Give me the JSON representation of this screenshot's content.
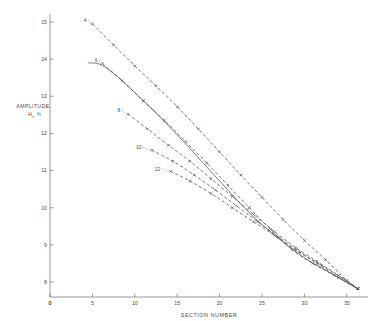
{
  "chart_data": {
    "type": "line",
    "title": "",
    "xlabel": "SECTION   NUMBER",
    "ylabel_main": "AMPLITUDE",
    "ylabel_sub_symbol": "H",
    "ylabel_sub_index": "s",
    "ylabel_units": "ft",
    "xlim": [
      0,
      37.5
    ],
    "ylim": [
      7.4,
      15.4
    ],
    "xticks": [
      0,
      5,
      10,
      15,
      20,
      25,
      30,
      35
    ],
    "xtick_labels": [
      "0",
      "5",
      "10",
      "15",
      "20",
      "25",
      "30",
      "35"
    ],
    "yticks": [
      8,
      9,
      10,
      11,
      12,
      13,
      14,
      15
    ],
    "ytick_labels": [
      "8",
      "9",
      "10",
      "11",
      "12",
      "13",
      "14",
      "15"
    ],
    "y_origin_label": "0",
    "grid": false,
    "legend_position": "inline-curve-labels",
    "axis_color": "#6e6e6e",
    "line_color": "#4f4f4f",
    "background": "#ffffff",
    "series": [
      {
        "name": "4",
        "label": "4",
        "style": "dashed",
        "marker": "x",
        "label_x": 4.3,
        "label_y": 15.05,
        "x": [
          5,
          7.5,
          10,
          12.5,
          15,
          17.5,
          20,
          22.5,
          25,
          27.5,
          30,
          32.5,
          35,
          36.3
        ],
        "y": [
          14.95,
          14.38,
          13.82,
          13.28,
          12.72,
          12.12,
          11.5,
          10.88,
          10.28,
          9.68,
          9.12,
          8.6,
          8.05,
          7.82
        ]
      },
      {
        "name": "6",
        "label": "6",
        "style": "dashed",
        "marker": "x",
        "label_x": 5.6,
        "label_y": 13.98,
        "x": [
          6.2,
          8.5,
          11,
          13.5,
          16,
          18.5,
          21,
          23.5,
          26,
          28.5,
          31,
          33.5,
          36.3
        ],
        "y": [
          13.88,
          13.42,
          12.88,
          12.35,
          11.78,
          11.2,
          10.6,
          10.0,
          9.42,
          8.88,
          8.5,
          8.18,
          7.82
        ]
      },
      {
        "name": "theoretical",
        "label": "",
        "style": "solid",
        "marker": "none",
        "label_x": null,
        "label_y": null,
        "x": [
          4.5,
          6,
          8,
          10,
          12,
          14,
          16,
          18,
          20,
          22,
          24,
          26,
          28,
          30,
          32,
          34,
          36.3
        ],
        "y": [
          13.9,
          13.85,
          13.52,
          13.1,
          12.66,
          12.2,
          11.72,
          11.22,
          10.72,
          10.22,
          9.75,
          9.35,
          8.98,
          8.65,
          8.38,
          8.12,
          7.82
        ]
      },
      {
        "name": "8",
        "label": "8",
        "style": "dashed",
        "marker": "x",
        "label_x": 8.3,
        "label_y": 12.62,
        "x": [
          9.2,
          11.5,
          14,
          16.5,
          19,
          21.5,
          24,
          26.5,
          29,
          31.5,
          34,
          36.3
        ],
        "y": [
          12.52,
          12.12,
          11.68,
          11.25,
          10.78,
          10.3,
          9.82,
          9.35,
          8.92,
          8.55,
          8.18,
          7.82
        ]
      },
      {
        "name": "10",
        "label": "10",
        "style": "dashed",
        "marker": "x",
        "label_x": 10.8,
        "label_y": 11.62,
        "x": [
          12,
          14.5,
          17,
          19.5,
          22,
          24.5,
          27,
          29.5,
          32,
          34.5,
          36.3
        ],
        "y": [
          11.55,
          11.25,
          10.88,
          10.48,
          10.05,
          9.62,
          9.2,
          8.8,
          8.45,
          8.1,
          7.82
        ]
      },
      {
        "name": "12",
        "label": "12",
        "style": "dashed",
        "marker": "x",
        "label_x": 13.0,
        "label_y": 11.05,
        "x": [
          14.2,
          16.5,
          19,
          21.5,
          24,
          26.5,
          29,
          31.5,
          34,
          36.3
        ],
        "y": [
          10.98,
          10.72,
          10.38,
          10.0,
          9.62,
          9.25,
          8.85,
          8.5,
          8.12,
          7.82
        ]
      }
    ]
  }
}
